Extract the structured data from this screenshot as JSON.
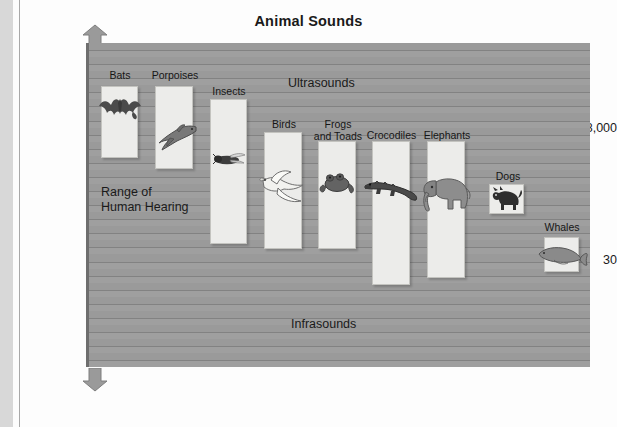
{
  "figure": {
    "title": "Animal Sounds"
  },
  "axis": {
    "y_title_line1": "Frequency",
    "y_title_line2": "(Hertz)",
    "ticks": [
      {
        "label": "18,000",
        "value": 18000
      },
      {
        "label": "30",
        "value": 30
      }
    ],
    "arrow_up": "up-arrow",
    "arrow_down": "down-arrow"
  },
  "zones": [
    {
      "name": "ultrasounds",
      "label": "Ultrasounds"
    },
    {
      "name": "human-hearing",
      "label": "Range of\nHuman Hearing"
    },
    {
      "name": "infrasounds",
      "label": "Infrasounds"
    }
  ],
  "colors": {
    "plot_background": "#9a9a9a",
    "gridline": "#7d7d7d",
    "bar_fill": "#ececea",
    "bar_border": "#c3c3bf",
    "text": "#1a1a1a",
    "page": "#fdfdfd"
  },
  "chart_data": {
    "type": "bar",
    "title": "Animal Sounds",
    "xlabel": "",
    "ylabel": "Frequency (Hertz)",
    "y_scale": "logarithmic",
    "y_tick_labels": [
      "18,000",
      "30"
    ],
    "annotations": [
      "Ultrasounds",
      "Range of Human Hearing",
      "Infrasounds"
    ],
    "grid": true,
    "legend": "none",
    "note": "Each bar spans the hearing/vocalization frequency range of an animal. Bar top = highest frequency, bar bottom = lowest frequency. Values below are read off the chart relative to the 18,000 Hz and 30 Hz reference lines.",
    "categories": [
      "Bats",
      "Porpoises",
      "Insects",
      "Birds",
      "Frogs and Toads",
      "Crocodiles",
      "Elephants",
      "Dogs",
      "Whales"
    ],
    "series": [
      {
        "name": "Frequency range high (Hz)",
        "values": [
          120000,
          120000,
          90000,
          30000,
          30000,
          25000,
          25000,
          8000,
          1000
        ]
      },
      {
        "name": "Frequency range low (Hz)",
        "values": [
          1000,
          150,
          40,
          40,
          40,
          10,
          15,
          300,
          15
        ]
      }
    ],
    "bars": [
      {
        "label": "Bats",
        "icon": "bat-icon",
        "x": 98,
        "y": 86,
        "w": 37,
        "h": 72,
        "label_x": 96,
        "label_y": 70,
        "label_w": 42
      },
      {
        "label": "Porpoises",
        "icon": "dolphin-icon",
        "x": 152,
        "y": 86,
        "w": 38,
        "h": 83,
        "label_x": 143,
        "label_y": 70,
        "label_w": 58
      },
      {
        "label": "Insects",
        "icon": "insect-icon",
        "x": 207,
        "y": 99,
        "w": 37,
        "h": 145,
        "label_x": 201,
        "label_y": 86,
        "label_w": 50
      },
      {
        "label": "Birds",
        "icon": "bird-icon",
        "x": 261,
        "y": 132,
        "w": 38,
        "h": 117,
        "label_x": 258,
        "label_y": 119,
        "label_w": 46
      },
      {
        "label": "Frogs\nand Toads",
        "icon": "frog-icon",
        "x": 315,
        "y": 141,
        "w": 38,
        "h": 108,
        "label_x": 305,
        "label_y": 119,
        "label_w": 60
      },
      {
        "label": "Crocodiles",
        "icon": "crocodile-icon",
        "x": 369,
        "y": 141,
        "w": 38,
        "h": 144,
        "label_x": 357,
        "label_y": 130,
        "label_w": 63
      },
      {
        "label": "Elephants",
        "icon": "elephant-icon",
        "x": 424,
        "y": 141,
        "w": 38,
        "h": 137,
        "label_x": 414,
        "label_y": 130,
        "label_w": 60
      },
      {
        "label": "Dogs",
        "icon": "dog-icon",
        "x": 486,
        "y": 184,
        "w": 35,
        "h": 30,
        "label_x": 485,
        "label_y": 171,
        "label_w": 40
      },
      {
        "label": "Whales",
        "icon": "whale-icon",
        "x": 541,
        "y": 237,
        "w": 35,
        "h": 35,
        "label_x": 534,
        "label_y": 222,
        "label_w": 50
      }
    ]
  }
}
